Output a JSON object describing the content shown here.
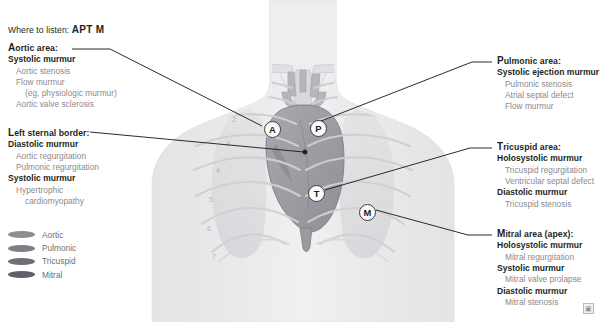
{
  "header": {
    "prefix": "Where to listen:",
    "mnemonic": "APT M"
  },
  "colors": {
    "aortic": "#8d8d92",
    "pulmonic": "#7e7e84",
    "tricuspid": "#6f6f75",
    "mitral": "#616167",
    "text": "#231f20",
    "cause_text": "#8a8a8e",
    "leader_line": "#231f20"
  },
  "areas": {
    "aortic": {
      "title": "Aortic area:",
      "groups": [
        {
          "murmur": "Systolic murmur",
          "causes": [
            {
              "text": "Aortic stenosis",
              "indent": 0
            },
            {
              "text": "Flow murmur",
              "indent": 0
            },
            {
              "text": "(eg, physiologic murmur)",
              "indent": 1
            },
            {
              "text": "Aortic valve sclerosis",
              "indent": 0
            }
          ]
        }
      ]
    },
    "left_sternal_border": {
      "title": "Left sternal border:",
      "groups": [
        {
          "murmur": "Diastolic murmur",
          "causes": [
            {
              "text": "Aortic regurgitation",
              "indent": 0
            },
            {
              "text": "Pulmonic regurgitation",
              "indent": 0
            }
          ]
        },
        {
          "murmur": "Systolic murmur",
          "causes": [
            {
              "text": "Hypertrophic",
              "indent": 0
            },
            {
              "text": "cardiomyopathy",
              "indent": 1
            }
          ]
        }
      ]
    },
    "pulmonic": {
      "title": "Pulmonic area:",
      "groups": [
        {
          "murmur": "Systolic ejection murmur",
          "causes": [
            {
              "text": "Pulmonic stenosis",
              "indent": 0
            },
            {
              "text": "Atrial septal defect",
              "indent": 0
            },
            {
              "text": "Flow murmur",
              "indent": 0
            }
          ]
        }
      ]
    },
    "tricuspid": {
      "title": "Tricuspid area:",
      "groups": [
        {
          "murmur": "Holosystolic murmur",
          "causes": [
            {
              "text": "Tricuspid regurgitation",
              "indent": 0
            },
            {
              "text": "Ventricular septal defect",
              "indent": 0
            }
          ]
        },
        {
          "murmur": "Diastolic murmur",
          "causes": [
            {
              "text": "Tricuspid stenosis",
              "indent": 0
            }
          ]
        }
      ]
    },
    "mitral": {
      "title": "Mitral area (apex):",
      "groups": [
        {
          "murmur": "Holosystolic murmur",
          "causes": [
            {
              "text": "Mitral regurgitation",
              "indent": 0
            }
          ]
        },
        {
          "murmur": "Systolic murmur",
          "causes": [
            {
              "text": "Mitral valve prolapse",
              "indent": 0
            }
          ]
        },
        {
          "murmur": "Diastolic murmur",
          "causes": [
            {
              "text": "Mitral stenosis",
              "indent": 0
            }
          ]
        }
      ]
    }
  },
  "legend": {
    "items": [
      {
        "label": "Aortic",
        "color": "#8d8d92"
      },
      {
        "label": "Pulmonic",
        "color": "#7e7e84"
      },
      {
        "label": "Tricuspid",
        "color": "#6f6f75"
      },
      {
        "label": "Mitral",
        "color": "#616167"
      }
    ]
  },
  "markers": [
    {
      "letter": "A",
      "name": "aortic",
      "x": 264,
      "y": 121
    },
    {
      "letter": "P",
      "name": "pulmonic",
      "x": 310,
      "y": 120
    },
    {
      "letter": "T",
      "name": "tricuspid",
      "x": 308,
      "y": 185
    },
    {
      "letter": "M",
      "name": "mitral",
      "x": 359,
      "y": 204
    }
  ],
  "rib_numbers": [
    "1",
    "2",
    "3",
    "4",
    "5",
    "6",
    "7"
  ],
  "watermark": {
    "glyph": "▣"
  }
}
